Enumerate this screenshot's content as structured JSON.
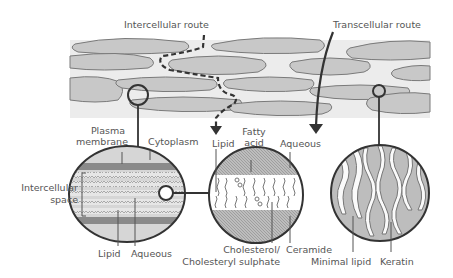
{
  "title_labels": {
    "intercellular_route": "Intercellular route",
    "transcellular_route": "Transcellular route"
  },
  "left_detail": {
    "plasma_membrane_line1": "Plasma",
    "plasma_membrane_line2": "membrane",
    "cytoplasm": "Cytoplasm",
    "intercellular_space_line1": "Intercellular",
    "intercellular_space_line2": "space",
    "lipid": "Lipid",
    "aqueous": "Aqueous"
  },
  "middle_detail": {
    "lipid": "Lipid",
    "fatty_acid_line1": "Fatty",
    "fatty_acid_line2": "acid",
    "aqueous": "Aqueous",
    "cholesterol_line1": "Cholesterol/",
    "cholesterol_line2": "Cholesteryl sulphate",
    "ceramide": "Ceramide"
  },
  "right_detail": {
    "minimal_lipid": "Minimal lipid",
    "keratin": "Keratin"
  },
  "colors": {
    "cell_fill": "#c8c8c8",
    "band_fill": "#ececec",
    "outline": "#3a3a3a",
    "text": "#555555"
  }
}
